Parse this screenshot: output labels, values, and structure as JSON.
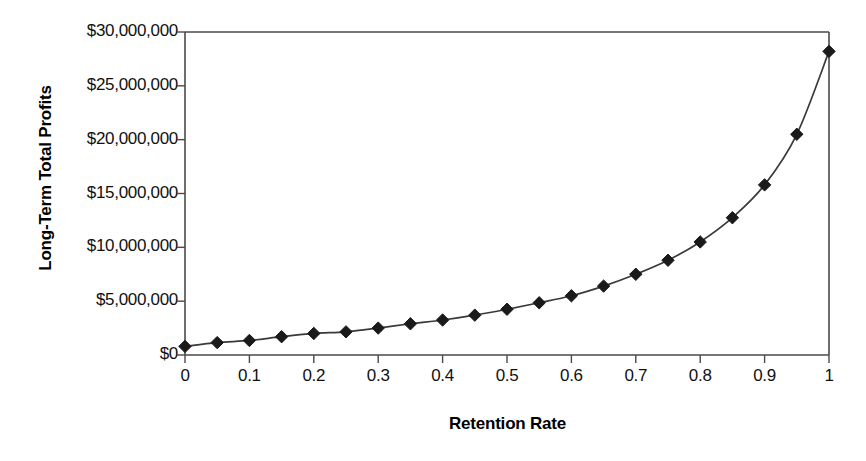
{
  "chart_data": {
    "type": "line",
    "title": "",
    "xlabel": "Retention Rate",
    "ylabel": "Long-Term Total Profits",
    "xlim": [
      0,
      1
    ],
    "ylim": [
      0,
      30000000
    ],
    "grid": false,
    "legend": null,
    "marker": "diamond",
    "marker_color": "#1a1a1a",
    "line_color": "#3a3a3a",
    "x_tick_labels": [
      "0",
      "0.1",
      "0.2",
      "0.3",
      "0.4",
      "0.5",
      "0.6",
      "0.7",
      "0.8",
      "0.9",
      "1"
    ],
    "x_tick_values": [
      0,
      0.1,
      0.2,
      0.3,
      0.4,
      0.5,
      0.6,
      0.7,
      0.8,
      0.9,
      1
    ],
    "y_tick_labels": [
      "$0",
      "$5,000,000",
      "$10,000,000",
      "$15,000,000",
      "$20,000,000",
      "$25,000,000",
      "$30,000,000"
    ],
    "y_tick_values": [
      0,
      5000000,
      10000000,
      15000000,
      20000000,
      25000000,
      30000000
    ],
    "x": [
      0,
      0.05,
      0.1,
      0.15,
      0.2,
      0.25,
      0.3,
      0.35,
      0.4,
      0.45,
      0.5,
      0.55,
      0.6,
      0.65,
      0.7,
      0.75,
      0.8,
      0.85,
      0.9,
      0.95,
      1
    ],
    "values": [
      800000,
      1150000,
      1350000,
      1700000,
      2000000,
      2150000,
      2500000,
      2900000,
      3250000,
      3700000,
      4250000,
      4850000,
      5500000,
      6400000,
      7500000,
      8800000,
      10500000,
      12750000,
      15800000,
      20500000,
      28200000
    ]
  }
}
